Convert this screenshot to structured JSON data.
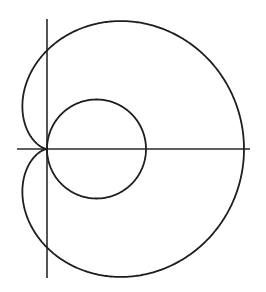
{
  "diagram": {
    "type": "polar-curves",
    "origin": {
      "x": 47,
      "y": 149
    },
    "axes": {
      "horizontal": {
        "x1": 17,
        "x2": 250,
        "y": 149
      },
      "vertical": {
        "x": 47,
        "y1": 19,
        "y2": 278
      }
    },
    "curves": [
      {
        "name": "cardioid",
        "equation": "r = a(1 + cos θ)",
        "a": 98.5
      },
      {
        "name": "circle",
        "equation": "r = 2c cos θ",
        "c": 49.5
      }
    ],
    "colors": {
      "stroke": "#1e1e1e",
      "background": "#ffffff"
    }
  }
}
